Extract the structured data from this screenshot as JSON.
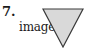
{
  "problem": {
    "number": "7.",
    "label": "image"
  },
  "figure": {
    "shape": "inverted-triangle",
    "fill_color": "#d9d9d9",
    "stroke_color": "#3a3a3a"
  }
}
